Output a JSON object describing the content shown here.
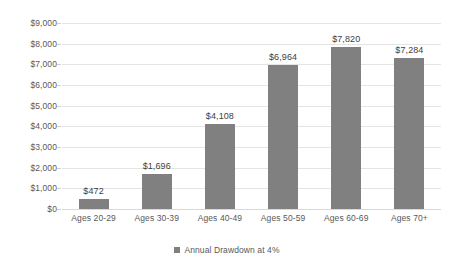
{
  "chart_data": {
    "type": "bar",
    "title": "",
    "subtitle": "",
    "xlabel": "",
    "ylabel": "",
    "categories": [
      "Ages 20-29",
      "Ages 30-39",
      "Ages 40-49",
      "Ages 50-59",
      "Ages 60-69",
      "Ages 70+"
    ],
    "values": [
      472,
      1696,
      4108,
      6964,
      7820,
      7284
    ],
    "data_labels": [
      "$472",
      "$1,696",
      "$4,108",
      "$6,964",
      "$7,820",
      "$7,284"
    ],
    "series": [
      {
        "name": "Annual Drawdown at 4%",
        "values": [
          472,
          1696,
          4108,
          6964,
          7820,
          7284
        ],
        "color": "#808080"
      }
    ],
    "ylim": [
      0,
      9000
    ],
    "ytick_values": [
      0,
      1000,
      2000,
      3000,
      4000,
      5000,
      6000,
      7000,
      8000,
      9000
    ],
    "ytick_labels": [
      "$0",
      "$1,000",
      "$2,000",
      "$3,000",
      "$4,000",
      "$5,000",
      "$6,000",
      "$7,000",
      "$8,000",
      "$9,000"
    ],
    "grid": true,
    "grid_axis": "y",
    "legend": {
      "position": "bottom",
      "entries": [
        {
          "label": "Annual Drawdown at 4%",
          "color": "#808080",
          "marker": "square"
        }
      ]
    },
    "colors": {
      "bar": "#808080",
      "gridline": "#e4e4e4",
      "text": "#595959",
      "data_label": "#404040",
      "background": "#ffffff"
    }
  }
}
